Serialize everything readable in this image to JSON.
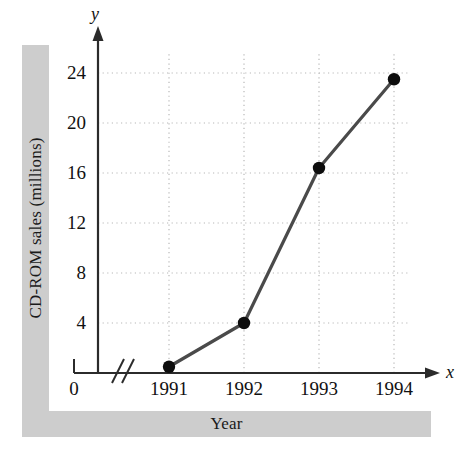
{
  "chart_data": {
    "type": "line",
    "title": "",
    "xlabel": "Year",
    "ylabel": "CD-ROM sales (millions)",
    "categories": [
      "1991",
      "1992",
      "1993",
      "1994"
    ],
    "x": [
      1991,
      1992,
      1993,
      1994
    ],
    "values": [
      0.5,
      4.0,
      16.4,
      23.5
    ],
    "series": [
      {
        "name": "CD-ROM sales (millions)",
        "values": [
          0.5,
          4.0,
          16.4,
          23.5
        ]
      }
    ],
    "ylim": [
      0,
      25.5
    ],
    "yticks": [
      4,
      8,
      12,
      16,
      20,
      24
    ],
    "ytick_labels": [
      "4",
      "8",
      "12",
      "16",
      "20",
      "24"
    ],
    "xtick_labels": [
      "1991",
      "1992",
      "1993",
      "1994"
    ],
    "origin_label": "0",
    "axis_break": true,
    "grid": true,
    "grid_style": "dotted",
    "legend": "none",
    "markers": "filled-circle",
    "axis_letter_x": "x",
    "axis_letter_y": "y",
    "colors": {
      "line": "#4a4a4a",
      "marker": "#0d0d0d",
      "grid": "#b8b8b8",
      "axis": "#2b2b2b",
      "band": "#cdcdcd",
      "text": "#111111",
      "background": "#ffffff"
    }
  }
}
